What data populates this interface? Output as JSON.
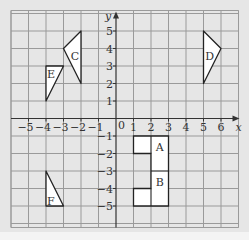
{
  "diagram": {
    "type": "coordinate-grid",
    "x_axis": {
      "label": "x",
      "min": -6,
      "max": 7,
      "ticks": [
        -5,
        -4,
        -3,
        -2,
        -1,
        1,
        2,
        3,
        4,
        5,
        6
      ]
    },
    "y_axis": {
      "label": "y",
      "min": -6,
      "max": 6,
      "ticks": [
        5,
        4,
        3,
        2,
        1,
        -1,
        -2,
        -3,
        -4,
        -5
      ]
    },
    "origin_label": "0",
    "colors": {
      "background": "#e6e6e6",
      "grid": "#9a9a9a",
      "axis": "#333333",
      "shape_fill": "#ffffff",
      "shape_stroke": "#222222"
    },
    "shapes": [
      {
        "name": "C",
        "vertices": [
          [
            -3,
            4
          ],
          [
            -2,
            5
          ],
          [
            -2,
            2
          ]
        ],
        "label_pos": [
          -2.35,
          3.6
        ]
      },
      {
        "name": "E",
        "vertices": [
          [
            -4,
            3
          ],
          [
            -3,
            3
          ],
          [
            -4,
            1
          ]
        ],
        "label_pos": [
          -3.72,
          2.55
        ]
      },
      {
        "name": "D",
        "vertices": [
          [
            5,
            5
          ],
          [
            6,
            4
          ],
          [
            5,
            2
          ]
        ],
        "label_pos": [
          5.35,
          3.6
        ]
      },
      {
        "name": "F",
        "vertices": [
          [
            -4,
            -3
          ],
          [
            -4,
            -5
          ],
          [
            -3,
            -5
          ]
        ],
        "label_pos": [
          -3.72,
          -4.7
        ]
      },
      {
        "name": "A",
        "label_pos": [
          2.5,
          -1.6
        ]
      },
      {
        "name": "B",
        "label_pos": [
          2.5,
          -3.6
        ]
      }
    ],
    "ab_outline": [
      [
        1,
        -1
      ],
      [
        3,
        -1
      ],
      [
        3,
        -5
      ],
      [
        1,
        -5
      ],
      [
        1,
        -4
      ],
      [
        2,
        -4
      ],
      [
        2,
        -2
      ],
      [
        1,
        -2
      ]
    ]
  }
}
